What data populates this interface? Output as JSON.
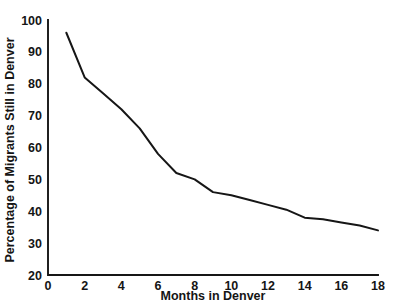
{
  "chart_data": {
    "type": "line",
    "title": "",
    "xlabel": "Months in Denver",
    "ylabel": "Percentage of Migrants Still in Denver",
    "xlim": [
      0,
      18
    ],
    "ylim": [
      20,
      100
    ],
    "grid": false,
    "legend": null,
    "xticks": [
      0,
      2,
      4,
      6,
      8,
      10,
      12,
      14,
      16,
      18
    ],
    "xtick_labels": [
      "0",
      "2",
      "4",
      "6",
      "8",
      "10",
      "12",
      "14",
      "16",
      "18"
    ],
    "yticks": [
      20,
      30,
      40,
      50,
      60,
      70,
      80,
      90,
      100
    ],
    "ytick_labels": [
      "20",
      "30",
      "40",
      "50",
      "60",
      "70",
      "80",
      "90",
      "100"
    ],
    "series": [
      {
        "name": "Percentage of Migrants Still in Denver",
        "color": "#161616",
        "x": [
          1,
          2,
          3,
          4,
          5,
          6,
          7,
          8,
          9,
          10,
          11,
          12,
          13,
          14,
          15,
          16,
          17,
          18
        ],
        "values": [
          96,
          82,
          77,
          72,
          66,
          58,
          52,
          50,
          46,
          45,
          43.5,
          42,
          40.5,
          38,
          37.5,
          36.5,
          35.5,
          34
        ]
      }
    ]
  },
  "axes": {
    "x_axis_name": "x-axis",
    "y_axis_name": "y-axis"
  }
}
